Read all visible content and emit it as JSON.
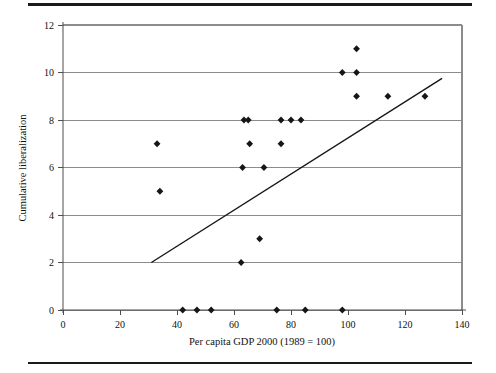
{
  "figure": {
    "background_color": "#ffffff",
    "rule_color": "#1a1a1a",
    "marker_color": "#161616",
    "grid_color": "#8c8c8c",
    "trendline_color": "#161616"
  },
  "chart_data": {
    "type": "scatter",
    "title": "",
    "xlabel": "Per capita GDP 2000 (1989 = 100)",
    "ylabel": "Cumulative liberalization",
    "xlim": [
      0,
      140
    ],
    "ylim": [
      0,
      12
    ],
    "xticks": [
      0,
      20,
      40,
      60,
      80,
      100,
      120,
      140
    ],
    "yticks": [
      0,
      2,
      4,
      6,
      8,
      10,
      12
    ],
    "xtick_labels": [
      "0",
      "20",
      "40",
      "60",
      "80",
      "100",
      "120",
      "140"
    ],
    "ytick_labels": [
      "0",
      "2",
      "4",
      "6",
      "8",
      "10",
      "12"
    ],
    "grid": "horizontal",
    "legend": "none",
    "series": [
      {
        "name": "Countries",
        "marker": "diamond",
        "points": [
          {
            "x": 33,
            "y": 7
          },
          {
            "x": 34,
            "y": 5
          },
          {
            "x": 42,
            "y": 0
          },
          {
            "x": 47,
            "y": 0
          },
          {
            "x": 52,
            "y": 0
          },
          {
            "x": 62.5,
            "y": 2
          },
          {
            "x": 63,
            "y": 6
          },
          {
            "x": 63.5,
            "y": 8
          },
          {
            "x": 65,
            "y": 8
          },
          {
            "x": 65.5,
            "y": 7
          },
          {
            "x": 69,
            "y": 3
          },
          {
            "x": 70.5,
            "y": 6
          },
          {
            "x": 75,
            "y": 0
          },
          {
            "x": 76.5,
            "y": 8
          },
          {
            "x": 76.5,
            "y": 7
          },
          {
            "x": 80,
            "y": 8
          },
          {
            "x": 83.5,
            "y": 8
          },
          {
            "x": 85,
            "y": 0
          },
          {
            "x": 98,
            "y": 0
          },
          {
            "x": 98,
            "y": 10
          },
          {
            "x": 103,
            "y": 11
          },
          {
            "x": 103,
            "y": 10
          },
          {
            "x": 103,
            "y": 9
          },
          {
            "x": 114,
            "y": 9
          },
          {
            "x": 127,
            "y": 9
          }
        ]
      }
    ],
    "trendline": {
      "name": "linear-fit",
      "x0": 31,
      "y0": 2,
      "x1": 133,
      "y1": 9.75
    }
  }
}
